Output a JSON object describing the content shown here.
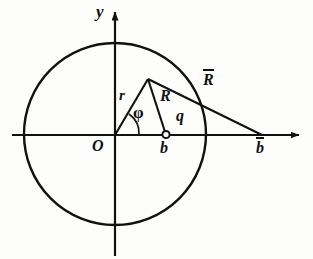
{
  "figure": {
    "background_color": "#fdfdfc",
    "stroke_color": "#111111",
    "axes": {
      "x_axis_label": "",
      "y_axis_label": "y",
      "origin_label": "O",
      "x_axis_y": 135,
      "y_axis_x": 115,
      "x_arrow_tip_x": 303,
      "y_arrow_tip_y": 8
    },
    "circle": {
      "center_x": 115,
      "center_y": 134,
      "radius": 91
    },
    "points": {
      "origin": {
        "label": "O",
        "x": 115,
        "y": 135
      },
      "apex": {
        "label": "",
        "x": 148,
        "y": 79
      },
      "b": {
        "label": "b",
        "x": 166,
        "y": 135,
        "marker": "open-circle"
      },
      "b_bar": {
        "label": "b̄",
        "x": 262,
        "y": 135
      }
    },
    "segments": [
      {
        "name": "r",
        "label": "r",
        "from": "origin",
        "to": "apex"
      },
      {
        "name": "R",
        "label": "R",
        "from": "apex",
        "to": "b"
      },
      {
        "name": "R-bar",
        "label": "R̄",
        "from": "apex",
        "to": "b_bar"
      },
      {
        "name": "q",
        "label": "q",
        "from": "b",
        "to": "b_bar"
      }
    ],
    "angle": {
      "label": "φ",
      "name": "phi",
      "vertex": "origin",
      "between": [
        "x-axis",
        "r"
      ]
    },
    "labels": {
      "y": "y",
      "O": "O",
      "r": "r",
      "phi": "φ",
      "R": "R",
      "q": "q",
      "b": "b",
      "R_bar_base": "R",
      "b_bar_base": "b"
    }
  }
}
